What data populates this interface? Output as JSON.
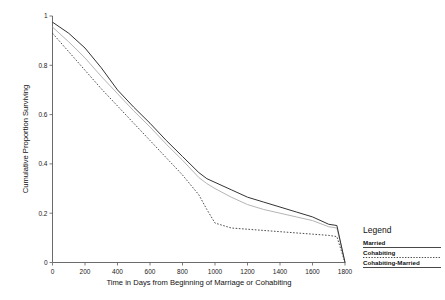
{
  "chart_data": {
    "type": "line",
    "title": "",
    "subtitle": "",
    "xlabel": "Time in Days from Beginning of Marriage or Cohabiting",
    "ylabel": "Cumulative Proportion Surviving",
    "xlim": [
      0,
      1800
    ],
    "ylim": [
      0,
      1
    ],
    "grid": false,
    "legend_position": "right",
    "xticks": [
      0,
      200,
      400,
      600,
      800,
      1000,
      1200,
      1400,
      1600,
      1800
    ],
    "xtick_labels": [
      "0",
      "200",
      "400",
      "600",
      "800",
      "1000",
      "1200",
      "1400",
      "1600",
      "1800"
    ],
    "yticks": [
      0,
      0.2,
      0.4,
      0.6,
      0.8,
      1
    ],
    "ytick_labels": [
      "0",
      "0.2",
      "0.4",
      "0.6",
      "0.8",
      "1"
    ],
    "x": [
      0,
      100,
      200,
      300,
      400,
      500,
      600,
      700,
      800,
      900,
      950,
      1000,
      1100,
      1200,
      1300,
      1400,
      1500,
      1600,
      1700,
      1750,
      1800
    ],
    "series": [
      {
        "name": "Married",
        "style": "solid",
        "color": "#333333",
        "values": [
          0.975,
          0.93,
          0.87,
          0.79,
          0.7,
          0.63,
          0.565,
          0.495,
          0.43,
          0.365,
          0.34,
          0.325,
          0.295,
          0.265,
          0.245,
          0.225,
          0.205,
          0.185,
          0.155,
          0.15,
          0.0
        ]
      },
      {
        "name": "Cohabiting",
        "style": "dotted",
        "color": "#3a3a3a",
        "values": [
          0.93,
          0.855,
          0.78,
          0.705,
          0.635,
          0.565,
          0.495,
          0.425,
          0.355,
          0.275,
          0.215,
          0.16,
          0.14,
          0.135,
          0.13,
          0.125,
          0.12,
          0.115,
          0.11,
          0.105,
          0.0
        ]
      },
      {
        "name": "Cohabiting-Married",
        "style": "solid-gray",
        "color": "#b5b5b5",
        "values": [
          0.955,
          0.895,
          0.83,
          0.755,
          0.685,
          0.615,
          0.55,
          0.48,
          0.415,
          0.345,
          0.32,
          0.3,
          0.265,
          0.235,
          0.215,
          0.2,
          0.185,
          0.17,
          0.145,
          0.14,
          0.0
        ]
      }
    ]
  },
  "axes": {
    "ylabel": "Cumulative Proportion Surviving",
    "xlabel": "Time in Days from Beginning of Marriage or Cohabiting"
  },
  "legend": {
    "title": "Legend",
    "entries": [
      {
        "label": "Married"
      },
      {
        "label": "Cohabiting"
      },
      {
        "label": "Cohabiting-Married"
      }
    ]
  }
}
